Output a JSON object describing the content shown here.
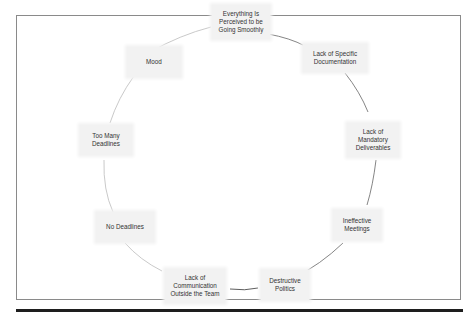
{
  "diagram": {
    "type": "cycle",
    "nodes": [
      {
        "id": "everything-perceived-smooth",
        "label": "Everything Is Perceived to be Going Smoothly"
      },
      {
        "id": "lack-specific-documentation",
        "label": "Lack of Specific Documentation"
      },
      {
        "id": "lack-mandatory-deliverables",
        "label": "Lack of Mandatory Deliverables"
      },
      {
        "id": "ineffective-meetings",
        "label": "Ineffective Meetings"
      },
      {
        "id": "destructive-politics",
        "label": "Destructive Politics"
      },
      {
        "id": "lack-communication-outside-team",
        "label": "Lack of Communication Outside the Team"
      },
      {
        "id": "no-deadlines",
        "label": "No Deadlines"
      },
      {
        "id": "too-many-deadlines",
        "label": "Too Many Deadlines"
      },
      {
        "id": "mood",
        "label": "Mood"
      }
    ],
    "colors": {
      "node_fill": "#f2f2f2",
      "connector": "#555555",
      "frame_border": "#8a8a8a",
      "rule": "#1e1e1e"
    }
  }
}
